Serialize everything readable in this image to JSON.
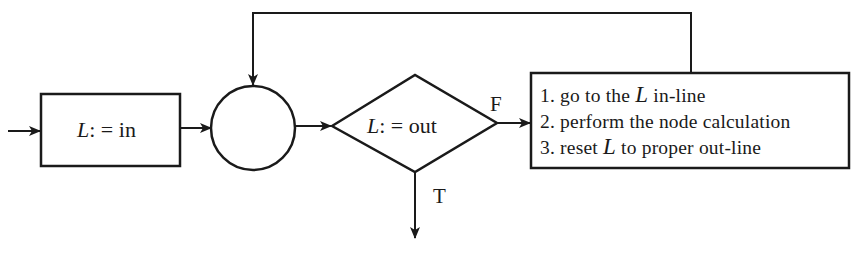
{
  "diagram": {
    "type": "flowchart",
    "colors": {
      "stroke": "#1a1a1a",
      "background": "#ffffff"
    },
    "nodes": {
      "init_box": {
        "shape": "rectangle",
        "var": "L",
        "op": ": =",
        "value": "in"
      },
      "junction": {
        "shape": "circle",
        "label": ""
      },
      "decision": {
        "shape": "diamond",
        "var": "L",
        "op": ": =",
        "value": "out"
      },
      "process_box": {
        "shape": "rectangle",
        "steps": [
          {
            "num": "1.",
            "pre": "go to the",
            "var": "L",
            "post": "in-line"
          },
          {
            "num": "2.",
            "text": "perform the node calculation"
          },
          {
            "num": "3.",
            "pre": "reset",
            "var": "L",
            "post": "to proper out-line"
          }
        ]
      }
    },
    "edges": [
      {
        "from": "start",
        "to": "init_box",
        "label": ""
      },
      {
        "from": "init_box",
        "to": "junction",
        "label": ""
      },
      {
        "from": "junction",
        "to": "decision",
        "label": ""
      },
      {
        "from": "decision",
        "to": "process_box",
        "label": "F"
      },
      {
        "from": "decision",
        "to": "exit",
        "label": "T"
      },
      {
        "from": "process_box",
        "to": "junction",
        "label": "",
        "route": "feedback-over-top"
      }
    ],
    "branch_labels": {
      "false": "F",
      "true": "T"
    }
  }
}
